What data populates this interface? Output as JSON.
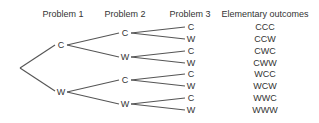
{
  "headers": {
    "problem1": "Problem 1",
    "problem2": "Problem 2",
    "problem3": "Problem 3",
    "outcomes": "Elementary outcomes"
  },
  "tree": {
    "level1": [
      "C",
      "W"
    ],
    "level2": [
      "C",
      "W",
      "C",
      "W"
    ],
    "level3": [
      "C",
      "W",
      "C",
      "W",
      "C",
      "W",
      "C",
      "W"
    ]
  },
  "outcomes": [
    "CCC",
    "CCW",
    "CWC",
    "CWW",
    "WCC",
    "WCW",
    "WWC",
    "WWW"
  ]
}
